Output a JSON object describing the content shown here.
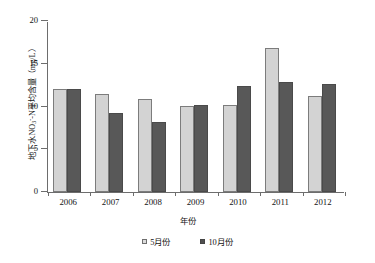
{
  "chart_data": {
    "type": "bar",
    "title": "",
    "categories": [
      "2006",
      "2007",
      "2008",
      "2009",
      "2010",
      "2011",
      "2012"
    ],
    "series": [
      {
        "name": "5月份",
        "values": [
          12.1,
          11.5,
          10.9,
          10.1,
          10.2,
          16.8,
          11.2
        ],
        "color": "#d3d3d3"
      },
      {
        "name": "10月份",
        "values": [
          12.1,
          9.2,
          8.2,
          10.2,
          12.4,
          12.9,
          12.6
        ],
        "color": "#585858"
      }
    ],
    "xlabel": "年份",
    "ylabel_parts": {
      "pre": "地下水NO",
      "sub": "3",
      "sup": "-",
      "post": "-N平均含量（mg/L）"
    },
    "ylabel": "地下水NO3--N平均含量（mg/L）",
    "ylim": [
      0,
      20
    ],
    "yticks": [
      0,
      5,
      10,
      15,
      20
    ],
    "ytick_labels": [
      "0",
      "5",
      "10",
      "15",
      "20"
    ],
    "grid": false,
    "legend_position": "bottom"
  },
  "legend": {
    "items": [
      {
        "label": "5月份",
        "marker": "legend-swatch-may"
      },
      {
        "label": "10月份",
        "marker": "legend-swatch-oct"
      }
    ]
  },
  "axes": {
    "x_title": "年份"
  }
}
